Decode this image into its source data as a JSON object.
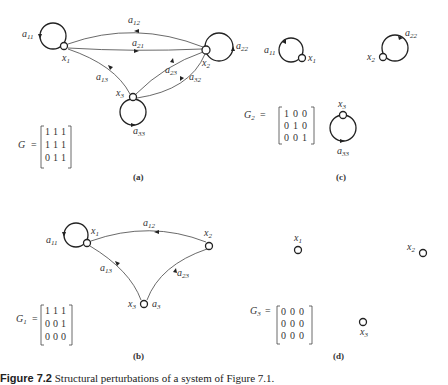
{
  "panels": {
    "a": {
      "label": "(a)",
      "matrix_name": "G",
      "matrix": [
        [
          "1",
          "1",
          "1"
        ],
        [
          "1",
          "1",
          "1"
        ],
        [
          "0",
          "1",
          "1"
        ]
      ],
      "nodes": [
        "x1",
        "x2",
        "x3"
      ],
      "edges": [
        "a11",
        "a12",
        "a21",
        "a13",
        "a22",
        "a23",
        "a32",
        "a33"
      ]
    },
    "b": {
      "label": "(b)",
      "matrix_name": "G1",
      "matrix": [
        [
          "1",
          "1",
          "1"
        ],
        [
          "0",
          "0",
          "1"
        ],
        [
          "0",
          "0",
          "0"
        ]
      ],
      "nodes": [
        "x1",
        "x2",
        "x3"
      ],
      "edges": [
        "a11",
        "a12",
        "a13",
        "a23"
      ],
      "extra_label": "a3"
    },
    "c": {
      "label": "(c)",
      "matrix_name": "G2",
      "matrix": [
        [
          "1",
          "0",
          "0"
        ],
        [
          "0",
          "1",
          "0"
        ],
        [
          "0",
          "0",
          "1"
        ]
      ],
      "nodes": [
        "x1",
        "x2",
        "x3"
      ],
      "edges": [
        "a11",
        "a22",
        "a33"
      ]
    },
    "d": {
      "label": "(d)",
      "matrix_name": "G3",
      "matrix": [
        [
          "0",
          "0",
          "0"
        ],
        [
          "0",
          "0",
          "0"
        ],
        [
          "0",
          "0",
          "0"
        ]
      ],
      "nodes": [
        "x1",
        "x2",
        "x3"
      ],
      "edges": []
    }
  },
  "text": {
    "a": "a",
    "x": "x",
    "G": "G",
    "eq": "=",
    "s1": "1",
    "s2": "2",
    "s3": "3",
    "s11": "11",
    "s12": "12",
    "s13": "13",
    "s21": "21",
    "s22": "22",
    "s23": "23",
    "s32": "32",
    "s33": "33"
  },
  "caption": {
    "prefix": "Figure 7.2",
    "text": " Structural perturbations of a system of Figure 7.1."
  }
}
